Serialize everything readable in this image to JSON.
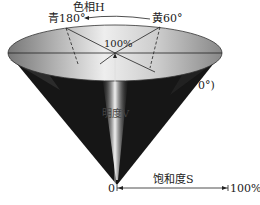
{
  "diagram": {
    "hue_label": "色相H",
    "cyan_label": "青180°",
    "yellow_label": "黄60°",
    "top_value_label": "100%",
    "red_label_partial": "0°)",
    "value_axis_label": "明度V",
    "saturation_label": "饱和度S",
    "origin_label": "0",
    "saturation_max_label": "100%"
  }
}
